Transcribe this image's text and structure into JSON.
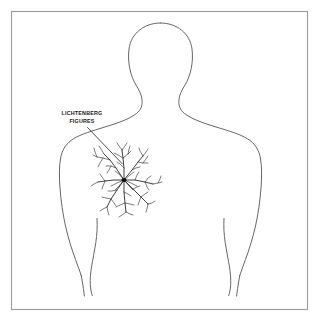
{
  "diagram": {
    "background_color": "#ffffff",
    "frame": {
      "name": "border-frame",
      "stroke_color": "#9a9a9a",
      "x": 11,
      "y": 11,
      "width": 297,
      "height": 299
    },
    "subject": {
      "name": "human-torso-outline",
      "description": "Front-facing outline of a human head, neck, shoulders, torso and arms",
      "stroke_color": "#5e5e5e"
    },
    "callout": {
      "name": "lichtenberg-figures-callout",
      "label_line_1": "LICHTENBERG",
      "label_line_2": "FIGURES",
      "text_color": "#1a1a1a",
      "leader_line": {
        "name": "callout-leader-line",
        "from_x": 88,
        "from_y": 128,
        "to_x": 122,
        "to_y": 164,
        "stroke_color": "#3a3a3a"
      }
    },
    "lichtenberg": {
      "name": "lichtenberg-figure-pattern",
      "description": "Branching fractal discharge pattern radiating from a dark central point on the left chest",
      "center_x": 124,
      "center_y": 180,
      "stroke_color": "#2b2b2b",
      "core_color": "#111111"
    }
  }
}
